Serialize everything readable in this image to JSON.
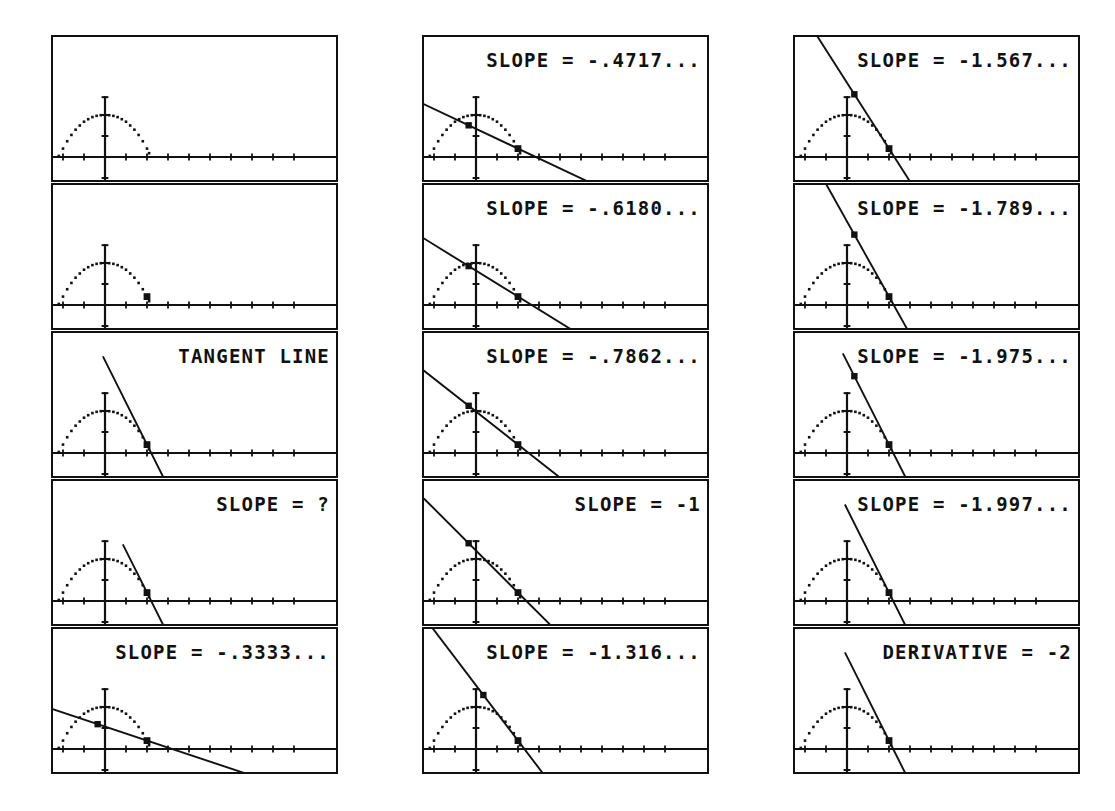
{
  "document": {
    "title": "Tangent line slope limit sequence (graphing calculator screens)",
    "description": "Fifteen graphing-calculator screenshots arranged in three columns of five, showing a dotted parabola y = 2 - x^2/2 with a secant/tangent line through the point (2, 0) whose slope converges to -2.",
    "background_color": "#ffffff",
    "ink_color": "#111111"
  },
  "layout": {
    "columns": 3,
    "rows_per_column": 5,
    "screen_width_px": 287,
    "screen_height_px": 147
  },
  "chart_data": {
    "type": "line",
    "xlabel": "",
    "ylabel": "",
    "xlim": [
      -5,
      9
    ],
    "ylim": [
      -3.2,
      3.2
    ],
    "grid": false,
    "legend": "none",
    "axis_tick_spacing": 1,
    "curve": {
      "name": "dotted parabola",
      "style": "dotted",
      "equation_points": [
        [
          -2.2,
          0.05
        ],
        [
          -2.0,
          0.4
        ],
        [
          -1.8,
          0.75
        ],
        [
          -1.6,
          1.05
        ],
        [
          -1.4,
          1.3
        ],
        [
          -1.2,
          1.5
        ],
        [
          -1.0,
          1.68
        ],
        [
          -0.8,
          1.8
        ],
        [
          -0.6,
          1.9
        ],
        [
          -0.4,
          1.96
        ],
        [
          -0.2,
          1.99
        ],
        [
          0.0,
          2.0
        ],
        [
          0.2,
          1.99
        ],
        [
          0.4,
          1.96
        ],
        [
          0.6,
          1.9
        ],
        [
          0.8,
          1.8
        ],
        [
          1.0,
          1.68
        ],
        [
          1.2,
          1.5
        ],
        [
          1.4,
          1.3
        ],
        [
          1.6,
          1.05
        ],
        [
          1.8,
          0.75
        ],
        [
          2.0,
          0.4
        ],
        [
          2.1,
          0.18
        ]
      ]
    },
    "anchor_point": {
      "x": 2.0,
      "y": 0.4,
      "label": "fixed point on curve"
    },
    "series": [
      {
        "name": "SLOPE = -.3333...",
        "slope": -0.3333,
        "value": -0.3333
      },
      {
        "name": "SLOPE = -.4717...",
        "slope": -0.4717,
        "value": -0.4717
      },
      {
        "name": "SLOPE = -.6180...",
        "slope": -0.618,
        "value": -0.618
      },
      {
        "name": "SLOPE = -.7862...",
        "slope": -0.7862,
        "value": -0.7862
      },
      {
        "name": "SLOPE = -1",
        "slope": -1,
        "value": -1
      },
      {
        "name": "SLOPE = -1.316...",
        "slope": -1.316,
        "value": -1.316
      },
      {
        "name": "SLOPE = -1.567...",
        "slope": -1.567,
        "value": -1.567
      },
      {
        "name": "SLOPE = -1.789...",
        "slope": -1.789,
        "value": -1.789
      },
      {
        "name": "SLOPE = -1.975...",
        "slope": -1.975,
        "value": -1.975
      },
      {
        "name": "SLOPE = -1.997...",
        "slope": -1.997,
        "value": -1.997
      },
      {
        "name": "DERIVATIVE = -2",
        "slope": -2,
        "value": -2
      }
    ],
    "limit_value": -2
  },
  "columns": [
    {
      "id": "col-0",
      "screens": [
        {
          "id": "screen-1-1",
          "label": "",
          "has_label": false,
          "has_line": false,
          "has_cursor": false,
          "cursor2": false,
          "slope": 0,
          "line_x0": 0,
          "line_x1": 0
        },
        {
          "id": "screen-1-2",
          "label": "",
          "has_label": false,
          "has_line": false,
          "has_cursor": true,
          "cursor2": false,
          "slope": 0,
          "line_x0": 0,
          "line_x1": 0
        },
        {
          "id": "screen-1-3",
          "label": "TANGENT LINE",
          "has_label": true,
          "has_line": true,
          "has_cursor": true,
          "cursor2": false,
          "slope": -2,
          "line_x0": -0.1,
          "line_x1": 3.5
        },
        {
          "id": "screen-1-4",
          "label": "SLOPE = ?",
          "has_label": true,
          "has_line": true,
          "has_cursor": true,
          "cursor2": false,
          "slope": -2,
          "line_x0": 0.85,
          "line_x1": 3.5
        },
        {
          "id": "screen-1-5",
          "label": "SLOPE = -.3333...",
          "has_label": true,
          "has_line": true,
          "has_cursor": true,
          "cursor2": true,
          "slope": -0.3333,
          "line_x0": -4.6,
          "line_x1": 8.6
        }
      ]
    },
    {
      "id": "col-1",
      "screens": [
        {
          "id": "screen-2-1",
          "label": "SLOPE = -.4717...",
          "has_label": true,
          "has_line": true,
          "has_cursor": true,
          "cursor2": true,
          "slope": -0.4717,
          "line_x0": -4.6,
          "line_x1": 7.2
        },
        {
          "id": "screen-2-2",
          "label": "SLOPE = -.6180...",
          "has_label": true,
          "has_line": true,
          "has_cursor": true,
          "cursor2": true,
          "slope": -0.618,
          "line_x0": -4.6,
          "line_x1": 6.0
        },
        {
          "id": "screen-2-3",
          "label": "SLOPE = -.7862...",
          "has_label": true,
          "has_line": true,
          "has_cursor": true,
          "cursor2": true,
          "slope": -0.7862,
          "line_x0": -4.6,
          "line_x1": 5.0
        },
        {
          "id": "screen-2-4",
          "label": "SLOPE = -1",
          "has_label": true,
          "has_line": true,
          "has_cursor": true,
          "cursor2": true,
          "slope": -1,
          "line_x0": -4.2,
          "line_x1": 4.3
        },
        {
          "id": "screen-2-5",
          "label": "SLOPE = -1.316...",
          "has_label": true,
          "has_line": true,
          "has_cursor": true,
          "cursor2": true,
          "slope": -1.316,
          "line_x0": -3.0,
          "line_x1": 3.9
        }
      ]
    },
    {
      "id": "col-2",
      "screens": [
        {
          "id": "screen-3-1",
          "label": "SLOPE = -1.567...",
          "has_label": true,
          "has_line": true,
          "has_cursor": true,
          "cursor2": true,
          "slope": -1.567,
          "line_x0": -1.9,
          "line_x1": 3.7
        },
        {
          "id": "screen-3-2",
          "label": "SLOPE = -1.789...",
          "has_label": true,
          "has_line": true,
          "has_cursor": true,
          "cursor2": true,
          "slope": -1.789,
          "line_x0": -1.2,
          "line_x1": 3.6
        },
        {
          "id": "screen-3-3",
          "label": "SLOPE = -1.975...",
          "has_label": true,
          "has_line": true,
          "has_cursor": true,
          "cursor2": true,
          "slope": -1.975,
          "line_x0": -0.2,
          "line_x1": 3.5
        },
        {
          "id": "screen-3-4",
          "label": "SLOPE = -1.997...",
          "has_label": true,
          "has_line": true,
          "has_cursor": true,
          "cursor2": false,
          "slope": -1.997,
          "line_x0": -0.1,
          "line_x1": 3.5
        },
        {
          "id": "screen-3-5",
          "label": "DERIVATIVE = -2",
          "has_label": true,
          "has_line": true,
          "has_cursor": true,
          "cursor2": false,
          "slope": -2,
          "line_x0": -0.1,
          "line_x1": 3.5
        }
      ]
    }
  ]
}
